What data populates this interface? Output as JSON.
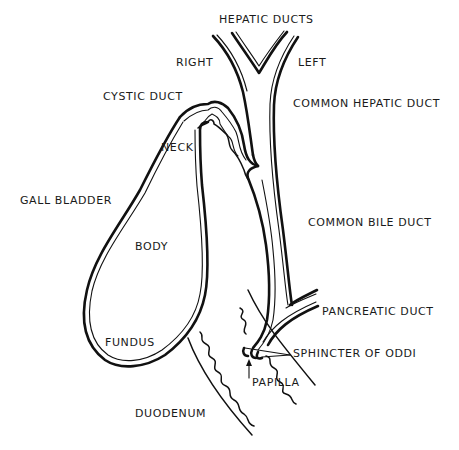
{
  "diagram": {
    "labels": {
      "hepatic_ducts": "HEPATIC DUCTS",
      "right": "RIGHT",
      "left": "LEFT",
      "cystic_duct": "CYSTIC DUCT",
      "common_hepatic_duct": "COMMON HEPATIC DUCT",
      "neck": "NECK",
      "gall_bladder": "GALL BLADDER",
      "common_bile_duct": "COMMON BILE DUCT",
      "body": "BODY",
      "pancreatic_duct": "PANCREATIC DUCT",
      "fundus": "FUNDUS",
      "sphincter_of_oddi": "SPHINCTER OF ODDI",
      "papilla": "PAPILLA",
      "duodenum": "DUODENUM"
    },
    "colors": {
      "ink": "#111111",
      "background": "#ffffff"
    }
  }
}
